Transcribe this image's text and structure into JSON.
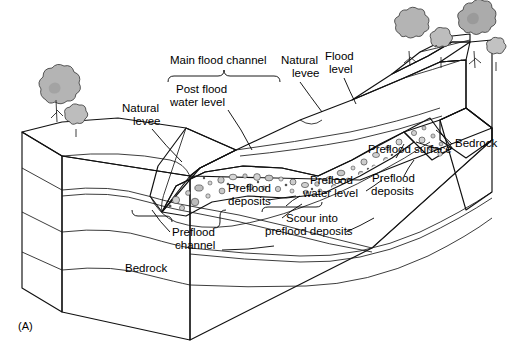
{
  "figure": {
    "id_label": "(A)",
    "title_implicit": "Block diagram of a flood-modified river valley"
  },
  "palette": {
    "background": "#ffffff",
    "ink": "#111111",
    "block_front": "#b9b9b9",
    "block_front_dark": "#a8a8a8",
    "block_side": "#c9c9c9",
    "top_surface": "#d8d8d8",
    "top_surface_light": "#e2e2e2",
    "terrace": "#cfcfcf",
    "channel_fill": "#c2c2c2",
    "deposit_fill": "#9e9e9e",
    "deposit_clast": "#d5d5d5",
    "tree_fill": "#b4b4b4",
    "tree_dark": "#8f8f8f",
    "water_fill": "#d0d0d0"
  },
  "labels": [
    {
      "name": "main-flood-channel",
      "text": "Main flood channel",
      "x": 170,
      "y": 64,
      "anchor": "start"
    },
    {
      "name": "post-flood-water-level-line1",
      "text": "Post flood",
      "x": 176,
      "y": 93,
      "anchor": "start"
    },
    {
      "name": "post-flood-water-level-line2",
      "text": "water level",
      "x": 170,
      "y": 106,
      "anchor": "start"
    },
    {
      "name": "natural-levee-left-line1",
      "text": "Natural",
      "x": 122,
      "y": 112,
      "anchor": "start"
    },
    {
      "name": "natural-levee-left-line2",
      "text": "levee",
      "x": 133,
      "y": 125,
      "anchor": "start"
    },
    {
      "name": "natural-levee-right-line1",
      "text": "Natural",
      "x": 281,
      "y": 64,
      "anchor": "start"
    },
    {
      "name": "natural-levee-right-line2",
      "text": "levee",
      "x": 292,
      "y": 77,
      "anchor": "start"
    },
    {
      "name": "flood-level-line1",
      "text": "Flood",
      "x": 325,
      "y": 60,
      "anchor": "start"
    },
    {
      "name": "flood-level-line2",
      "text": "level",
      "x": 329,
      "y": 73,
      "anchor": "start"
    },
    {
      "name": "preflood-surface",
      "text": "Preflood surface",
      "x": 368,
      "y": 153,
      "anchor": "start"
    },
    {
      "name": "bedrock-right",
      "text": "Bedrock",
      "x": 455,
      "y": 147,
      "anchor": "start"
    },
    {
      "name": "preflood-deposits-right-line1",
      "text": "Preflood",
      "x": 372,
      "y": 182,
      "anchor": "start"
    },
    {
      "name": "preflood-deposits-right-line2",
      "text": "deposits",
      "x": 371,
      "y": 195,
      "anchor": "start"
    },
    {
      "name": "preflood-water-level-line1",
      "text": "Preflood",
      "x": 310,
      "y": 184,
      "anchor": "start"
    },
    {
      "name": "preflood-water-level-line2",
      "text": "water level",
      "x": 303,
      "y": 197,
      "anchor": "start"
    },
    {
      "name": "preflood-deposits-left-line1",
      "text": "Preflood",
      "x": 228,
      "y": 192,
      "anchor": "start"
    },
    {
      "name": "preflood-deposits-left-line2",
      "text": "deposits",
      "x": 228,
      "y": 205,
      "anchor": "start"
    },
    {
      "name": "scour-into-line1",
      "text": "Scour into",
      "x": 286,
      "y": 222,
      "anchor": "start"
    },
    {
      "name": "scour-into-line2",
      "text": "preflood deposits",
      "x": 265,
      "y": 235,
      "anchor": "start"
    },
    {
      "name": "preflood-channel-line1",
      "text": "Preflood",
      "x": 172,
      "y": 236,
      "anchor": "start"
    },
    {
      "name": "preflood-channel-line2",
      "text": "channel",
      "x": 175,
      "y": 249,
      "anchor": "start"
    },
    {
      "name": "bedrock-left",
      "text": "Bedrock",
      "x": 125,
      "y": 272,
      "anchor": "start"
    }
  ],
  "annotations": {
    "brace_main_channel": "curly brace under Main flood channel",
    "brace_preflood_deposits": "brace under Preflood deposits",
    "brace_preflood_channel": "brace under Preflood channel"
  }
}
